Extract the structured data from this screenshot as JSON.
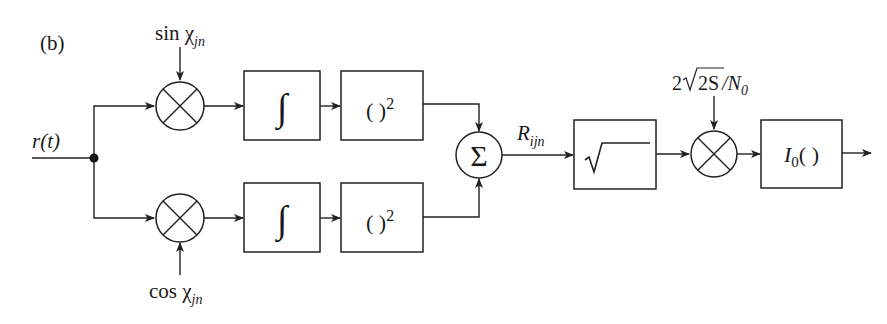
{
  "figure": {
    "panel_label": "(b)",
    "input_label": "r(t)",
    "upper_branch": {
      "mixer_input": "sin χ",
      "mixer_input_sub": "jn",
      "integrator_symbol": "∫",
      "square_label": "( )",
      "square_sup": "2"
    },
    "lower_branch": {
      "mixer_input": "cos χ",
      "mixer_input_sub": "jn",
      "integrator_symbol": "∫",
      "square_label": "( )",
      "square_sup": "2"
    },
    "summer_symbol": "Σ",
    "sum_output_label": "R",
    "sum_output_sub": "ijn",
    "sqrt_symbol": "√",
    "gain_label_prefix": "2√",
    "gain_label_rad": "2S",
    "gain_label_suffix": "/N",
    "gain_label_sub": "0",
    "bessel_label": "I",
    "bessel_sub": "0",
    "bessel_parens": "( )"
  }
}
